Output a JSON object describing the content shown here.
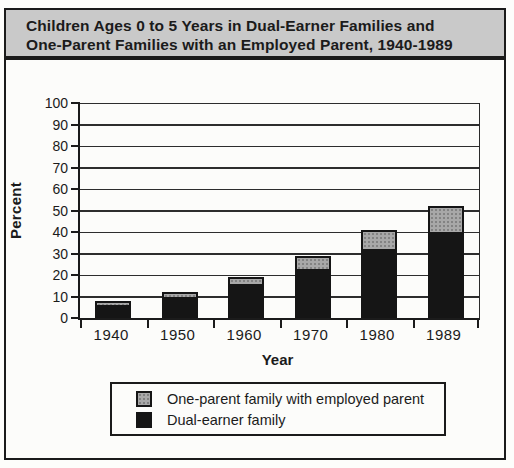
{
  "title": {
    "line1": "Children Ages 0 to 5 Years in Dual-Earner Families and",
    "line2": "One-Parent Families with an Employed Parent, 1940-1989"
  },
  "chart_data": {
    "type": "bar",
    "stacked": true,
    "title": "Children Ages 0 to 5 Years in Dual-Earner Families and One-Parent Families with an Employed Parent, 1940-1989",
    "categories": [
      "1940",
      "1950",
      "1960",
      "1970",
      "1980",
      "1989"
    ],
    "series": [
      {
        "name": "Dual-earner family",
        "color": "#151515",
        "values": [
          6,
          10,
          16,
          23,
          32,
          40
        ]
      },
      {
        "name": "One-parent family with employed parent",
        "color": "#a8a8a8",
        "values": [
          2,
          2,
          3,
          6,
          9,
          12
        ]
      }
    ],
    "stacked_totals": [
      8,
      12,
      19,
      29,
      41,
      52
    ],
    "xlabel": "Year",
    "ylabel": "Percent",
    "ylim": [
      0,
      100
    ],
    "ytick_interval": 10,
    "ytick_labels": [
      "0",
      "10",
      "20",
      "30",
      "40",
      "50",
      "60",
      "70",
      "80",
      "90",
      "100"
    ],
    "grid": "horizontal",
    "legend_position": "bottom"
  },
  "legend": {
    "items": [
      {
        "label": "One-parent family with employed parent",
        "swatch": "gray-dotted",
        "color": "#a8a8a8"
      },
      {
        "label": "Dual-earner family",
        "swatch": "black",
        "color": "#151515"
      }
    ]
  },
  "colors": {
    "title_bg": "#c9c9c9",
    "line": "#1b1b1b",
    "bar_dark": "#151515",
    "bar_gray": "#a8a8a8",
    "page_bg": "#fdfdfb",
    "plot_bg": "#fcfcfa"
  }
}
